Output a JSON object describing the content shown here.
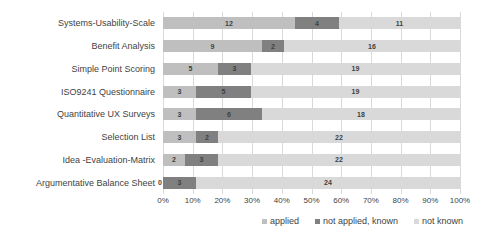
{
  "chart_data": {
    "type": "bar",
    "subtype": "horizontal-stacked-100-percent",
    "title": "",
    "xlabel": "",
    "ylabel": "",
    "xlim": [
      0,
      100
    ],
    "xtick_labels": [
      "0%",
      "10%",
      "20%",
      "30%",
      "40%",
      "50%",
      "60%",
      "70%",
      "80%",
      "90%",
      "100%"
    ],
    "xtick_values": [
      0,
      10,
      20,
      30,
      40,
      50,
      60,
      70,
      80,
      90,
      100
    ],
    "grid": true,
    "legend_position": "bottom-right",
    "total_per_category": 27,
    "categories": [
      "Systems-Usability-Scale",
      "Benefit Analysis",
      "Simple Point Scoring",
      "ISO9241 Questionnaire",
      "Quantitative UX Surveys",
      "Selection List",
      "Idea -Evaluation-Matrix",
      "Argumentative Balance Sheet"
    ],
    "series": [
      {
        "name": "applied",
        "color": "#bfbfbf",
        "values": [
          12,
          9,
          5,
          3,
          3,
          3,
          2,
          0
        ]
      },
      {
        "name": "not applied, known",
        "color": "#808080",
        "values": [
          4,
          2,
          3,
          5,
          6,
          2,
          3,
          3
        ]
      },
      {
        "name": "not known",
        "color": "#d9d9d9",
        "values": [
          11,
          16,
          19,
          19,
          18,
          22,
          22,
          24
        ]
      }
    ]
  },
  "legend": {
    "items": [
      {
        "label": "applied",
        "color": "#bfbfbf"
      },
      {
        "label": "not applied, known",
        "color": "#808080"
      },
      {
        "label": "not known",
        "color": "#d9d9d9"
      }
    ]
  }
}
